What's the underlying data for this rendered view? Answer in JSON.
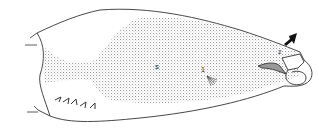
{
  "figure": {
    "labels": {
      "s": "s",
      "one": "1",
      "two": "2"
    },
    "colors": {
      "line": "#333333",
      "stipple": "#777777",
      "arrow": "#111111",
      "background": "#ffffff"
    }
  }
}
